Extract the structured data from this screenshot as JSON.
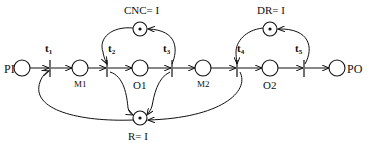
{
  "diagram": {
    "type": "petri-net",
    "places": [
      {
        "id": "PI",
        "label": "PI",
        "tokens": 0
      },
      {
        "id": "M1",
        "label": "M1",
        "tokens": 0
      },
      {
        "id": "O1",
        "label": "O1",
        "tokens": 0
      },
      {
        "id": "M2",
        "label": "M2",
        "tokens": 0
      },
      {
        "id": "O2",
        "label": "O2",
        "tokens": 0
      },
      {
        "id": "PO",
        "label": "PO",
        "tokens": 0
      },
      {
        "id": "CNC",
        "label": "CNC= I",
        "tokens": 1
      },
      {
        "id": "DR",
        "label": "DR= I",
        "tokens": 1
      },
      {
        "id": "R",
        "label": "R= I",
        "tokens": 1
      }
    ],
    "transitions": [
      {
        "id": "t1",
        "label": "t",
        "sub": "1"
      },
      {
        "id": "t2",
        "label": "t",
        "sub": "2"
      },
      {
        "id": "t3",
        "label": "t",
        "sub": "3"
      },
      {
        "id": "t4",
        "label": "t",
        "sub": "4"
      },
      {
        "id": "t5",
        "label": "t",
        "sub": "5"
      }
    ],
    "arcs": [
      [
        "PI",
        "t1"
      ],
      [
        "t1",
        "M1"
      ],
      [
        "M1",
        "t2"
      ],
      [
        "t2",
        "O1"
      ],
      [
        "O1",
        "t3"
      ],
      [
        "t3",
        "M2"
      ],
      [
        "M2",
        "t4"
      ],
      [
        "t4",
        "O2"
      ],
      [
        "O2",
        "t5"
      ],
      [
        "t5",
        "PO"
      ],
      [
        "CNC",
        "t2"
      ],
      [
        "t3",
        "CNC"
      ],
      [
        "DR",
        "t4"
      ],
      [
        "t5",
        "DR"
      ],
      [
        "R",
        "t1"
      ],
      [
        "R",
        "t2"
      ],
      [
        "t3",
        "R"
      ],
      [
        "t4",
        "R"
      ]
    ]
  }
}
